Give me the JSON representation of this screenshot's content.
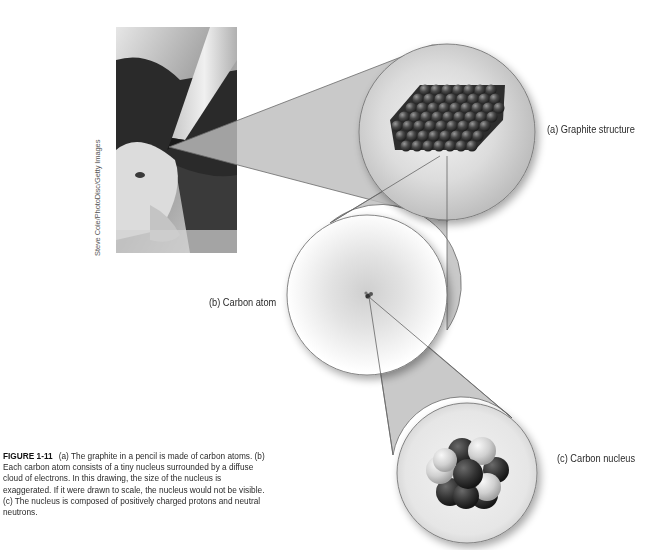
{
  "photo": {
    "subject": "pencil tip on paper with graphite shavings",
    "credit": "Steve Cole/PhotoDisc/Getty Images"
  },
  "panels": {
    "a": {
      "label": "(a) Graphite structure"
    },
    "b": {
      "label": "(b) Carbon atom"
    },
    "c": {
      "label": "(c) Carbon nucleus"
    }
  },
  "caption": {
    "figure_number": "FIGURE 1-11",
    "text": "(a) The graphite in a pencil is made of carbon atoms. (b) Each carbon atom consists of a tiny nucleus surrounded by a diffuse cloud of electrons. In this drawing, the size of the nucleus is exaggerated. If it were drawn to scale, the nucleus would not be visible. (c) The nucleus is composed of positively charged protons and neutral neutrons."
  },
  "colors": {
    "callout_fill": "#bdbdbd",
    "outline": "#6e6e6e",
    "atom_dark": "#3a3a3a",
    "proton_light": "#d8d8d8",
    "neutron_dark": "#333333"
  }
}
